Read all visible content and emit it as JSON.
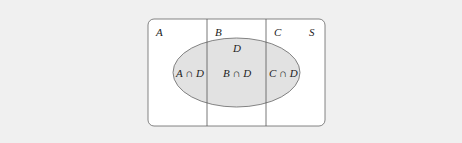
{
  "diagram": {
    "type": "venn-partition",
    "colors": {
      "background": "#f0f0f0",
      "universe_fill": "#ffffff",
      "ellipse_fill": "#e2e2e2",
      "stroke": "#555555"
    },
    "universe_label": "S",
    "partitions": [
      {
        "label": "A"
      },
      {
        "label": "B"
      },
      {
        "label": "C"
      }
    ],
    "event_label": "D",
    "intersections": [
      {
        "label": "A ∩ D"
      },
      {
        "label": "B ∩ D"
      },
      {
        "label": "C ∩ D"
      }
    ]
  }
}
